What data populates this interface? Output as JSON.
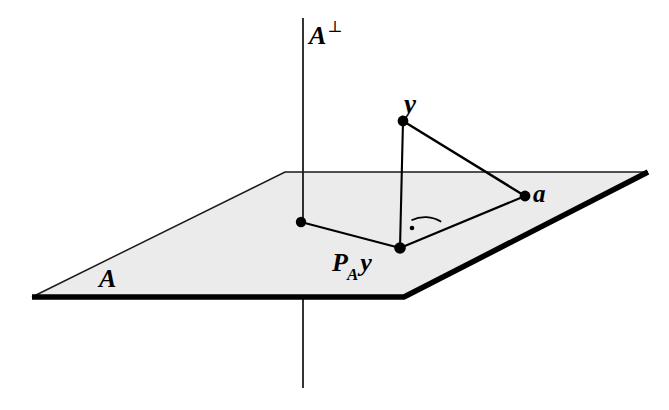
{
  "figure": {
    "background_color": "#ffffff",
    "width": 669,
    "height": 410
  },
  "labels": {
    "subspace_orthogonal": "A",
    "perp_symbol": "⊥",
    "point_y": "y",
    "point_a": "a",
    "projection_P": "P",
    "projection_sub": "A",
    "projection_y": "y",
    "subspace": "A"
  },
  "colors": {
    "plane_fill": "#ebebeb",
    "plane_thin_edge": "#1a1a1a",
    "plane_thick_edge": "#000000",
    "line": "#000000",
    "dot": "#000000",
    "text": "#000000"
  },
  "geometry": {
    "plane_corners": [
      {
        "name": "left",
        "x": 32,
        "y": 297
      },
      {
        "name": "top-left",
        "x": 285,
        "y": 172
      },
      {
        "name": "right",
        "x": 648,
        "y": 172
      },
      {
        "name": "bottom-right",
        "x": 404,
        "y": 297
      }
    ],
    "axis_vertical": {
      "x": 303,
      "y_top": 18,
      "y_bottom": 388
    },
    "points": [
      {
        "name": "y",
        "x": 403,
        "y": 121
      },
      {
        "name": "a",
        "x": 525,
        "y": 196
      },
      {
        "name": "P_A y",
        "x": 400,
        "y": 248
      },
      {
        "name": "axis-foot",
        "x": 301,
        "y": 222
      }
    ],
    "segments": [
      {
        "from": "y",
        "to": "P_A y"
      },
      {
        "from": "y",
        "to": "a"
      },
      {
        "from": "P_A y",
        "to": "a"
      },
      {
        "from": "P_A y",
        "to": "axis-foot"
      }
    ],
    "right_angle_marker": {
      "vertex": "P_A y",
      "radius": 30,
      "dot_offset": 17
    }
  }
}
